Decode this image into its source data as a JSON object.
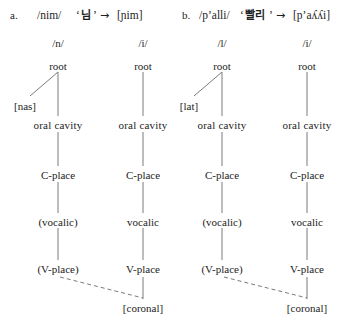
{
  "figure": {
    "type": "feature-geometry-tree",
    "examples": [
      {
        "id": "a",
        "label": "a.",
        "underlying": "/nim/",
        "orthography": "님",
        "arrow": "→",
        "surface": "[ɲim]",
        "columns": [
          {
            "phoneme": "/n/",
            "root": "root",
            "manner_feature": "[nas]",
            "oral_cavity": "oral cavity",
            "c_place": "C-place",
            "vocalic": "(vocalic)",
            "v_place": "(V-place)"
          },
          {
            "phoneme": "/i/",
            "root": "root",
            "manner_feature": null,
            "oral_cavity": "oral cavity",
            "c_place": "C-place",
            "vocalic": "vocalic",
            "v_place": "V-place"
          }
        ],
        "shared_feature": "[coronal]"
      },
      {
        "id": "b",
        "label": "b.",
        "underlying": "/pʼalli/",
        "orthography": "빨리",
        "arrow": "→",
        "surface": "[pʼaʎʎi]",
        "columns": [
          {
            "phoneme": "/l/",
            "root": "root",
            "manner_feature": "[lat]",
            "oral_cavity": "oral cavity",
            "c_place": "C-place",
            "vocalic": "(vocalic)",
            "v_place": "(V-place)"
          },
          {
            "phoneme": "/i/",
            "root": "root",
            "manner_feature": null,
            "oral_cavity": "oral cavity",
            "c_place": "C-place",
            "vocalic": "vocalic",
            "v_place": "V-place"
          }
        ],
        "shared_feature": "[coronal]"
      }
    ],
    "colors": {
      "text": "#1d1d1d",
      "line": "#6b6b6b",
      "background": "#ffffff"
    }
  }
}
